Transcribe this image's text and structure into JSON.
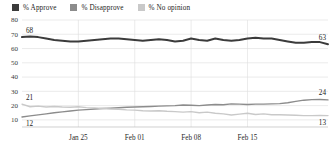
{
  "legend": {
    "position": "top-left",
    "items": [
      {
        "label": "% Approve",
        "color": "#3b3b3b",
        "icon": "legend-swatch-icon"
      },
      {
        "label": "% Disapprove",
        "color": "#8c8c8c",
        "icon": "legend-swatch-icon"
      },
      {
        "label": "% No opinion",
        "color": "#c9c9c9",
        "icon": "legend-swatch-icon"
      }
    ]
  },
  "chart_data": {
    "type": "line",
    "title": "",
    "subtitle": "",
    "xlabel": "",
    "ylabel": "",
    "ylim": [
      5,
      80
    ],
    "yticks": [
      10,
      20,
      30,
      40,
      50,
      60,
      70,
      80
    ],
    "ytick_labels": [
      "10",
      "20",
      "30",
      "40",
      "50",
      "60",
      "70",
      "80"
    ],
    "grid": true,
    "grid_axis": "both",
    "xticks": [
      7,
      14,
      21,
      28
    ],
    "xtick_labels": [
      "Jan 25",
      "Feb 01",
      "Feb 08",
      "Feb 15"
    ],
    "x": [
      0,
      1,
      2,
      3,
      4,
      5,
      6,
      7,
      8,
      9,
      10,
      11,
      12,
      13,
      14,
      15,
      16,
      17,
      18,
      19,
      20,
      21,
      22,
      23,
      24,
      25,
      26,
      27,
      28,
      29,
      30,
      31,
      32,
      33,
      34,
      35,
      36,
      37,
      38
    ],
    "series": [
      {
        "name": "% Approve",
        "color": "#3b3b3b",
        "width": 2.0,
        "start_label": "68",
        "end_label": "63",
        "values": [
          68,
          68.5,
          68,
          67,
          66,
          65.5,
          65,
          65,
          65.5,
          66,
          66.5,
          67,
          67,
          66.5,
          66,
          65.5,
          66,
          66.5,
          66,
          65,
          65.5,
          67,
          66,
          65.5,
          67,
          66,
          65.5,
          66,
          67,
          67.5,
          67,
          67,
          66,
          65,
          64,
          64,
          64.5,
          64.5,
          63
        ]
      },
      {
        "name": "% Disapprove",
        "color": "#8c8c8c",
        "width": 1.4,
        "start_label": "12",
        "end_label": "24",
        "values": [
          12,
          12.8,
          13.5,
          14.2,
          15,
          15.6,
          16.2,
          16.8,
          17.2,
          17.6,
          18,
          18.2,
          18.5,
          18.8,
          19,
          19.2,
          19.4,
          19.6,
          19.8,
          20,
          20.4,
          20.2,
          20,
          20.4,
          20.8,
          20.6,
          21.2,
          21,
          20.8,
          21,
          21,
          21.2,
          21.4,
          22,
          23,
          23.8,
          24.2,
          24.3,
          24
        ]
      },
      {
        "name": "% No opinion",
        "color": "#c9c9c9",
        "width": 1.4,
        "start_label": "21",
        "end_label": "13",
        "values": [
          21,
          19.2,
          19.6,
          19,
          19.4,
          19,
          18.8,
          19.2,
          18.6,
          18.4,
          18,
          17.6,
          17.4,
          17,
          16.8,
          16.4,
          16.2,
          16.4,
          16,
          15.8,
          15.4,
          15.8,
          15,
          15.4,
          14.6,
          14.2,
          13.4,
          14,
          14.6,
          13.8,
          14.2,
          13.6,
          13.6,
          13.4,
          13.2,
          13,
          13,
          13.1,
          13
        ]
      }
    ]
  }
}
